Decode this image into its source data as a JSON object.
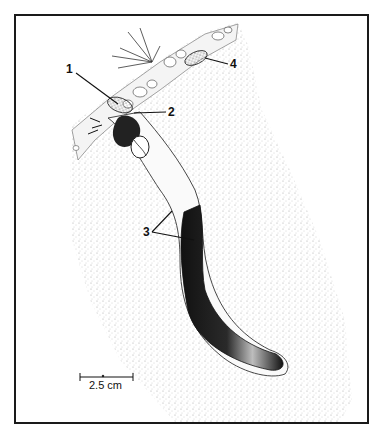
{
  "figure": {
    "labels": [
      {
        "id": "1",
        "text": "1"
      },
      {
        "id": "2",
        "text": "2"
      },
      {
        "id": "3",
        "text": "3"
      },
      {
        "id": "4",
        "text": "4"
      }
    ],
    "scale_bar": {
      "text": "2.5 cm"
    },
    "colors": {
      "ink": "#111111",
      "stipple": "#9a9a9a",
      "background": "#ffffff"
    }
  }
}
